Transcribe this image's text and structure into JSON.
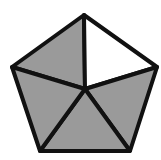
{
  "diagram": {
    "total_parts": 5,
    "shaded_parts": 4,
    "unshaded_parts": 1,
    "shaded_fraction": "4/5",
    "colors": {
      "shaded": "#9a9a9a",
      "unshaded": "#ffffff",
      "stroke": "#111111"
    },
    "vertices": {
      "top": [
        84,
        15
      ],
      "right": [
        157,
        67
      ],
      "bottom_right": [
        130,
        151
      ],
      "bottom_left": [
        40,
        151
      ],
      "left": [
        12,
        67
      ],
      "center": [
        85,
        89
      ]
    }
  }
}
